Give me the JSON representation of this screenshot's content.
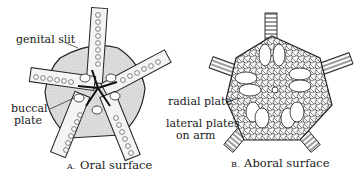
{
  "figure": {
    "panels": [
      {
        "id": "A",
        "letter": "A.",
        "caption": "Oral surface",
        "labels": {
          "genital_slit": "genital slit",
          "buccal_line1": "buccal",
          "buccal_line2": "plate"
        }
      },
      {
        "id": "B",
        "letter": "B.",
        "caption": "Aboral surface",
        "labels": {
          "radial_plate": "radial plate",
          "lateral_line1": "lateral plates",
          "lateral_line2": "on arm"
        }
      }
    ],
    "colors": {
      "ink": "#1a1a1a",
      "disc_fill": "#d9d9d9",
      "paper": "#ffffff"
    }
  }
}
